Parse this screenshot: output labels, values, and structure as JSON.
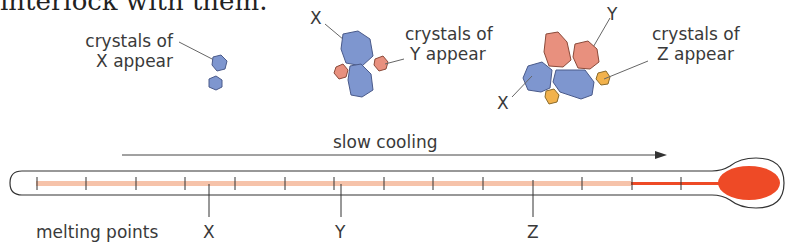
{
  "clipped_heading": "interlock with them.",
  "stages": [
    {
      "label_line1": "crystals of",
      "label_line2": "X appear"
    },
    {
      "label_line1": "crystals of",
      "label_line2": "Y appear",
      "existing_label": "X"
    },
    {
      "label_line1": "crystals of",
      "label_line2": "Z appear",
      "existing_labels": [
        "Y",
        "X"
      ]
    }
  ],
  "arrow_label": "slow cooling",
  "axis_label": "melting points",
  "melting_points": [
    "X",
    "Y",
    "Z"
  ],
  "colors": {
    "crystal_x": "#7e96cf",
    "crystal_y": "#e8907e",
    "crystal_z": "#f2b24c",
    "mercury": "#ee4a26",
    "tube_fill": "#f6c3aa"
  }
}
